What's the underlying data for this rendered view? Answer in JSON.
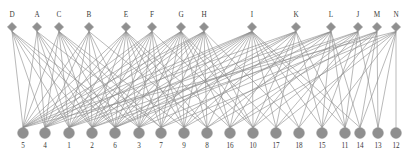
{
  "diagram": {
    "type": "bipartite-graph",
    "title": "",
    "colors": {
      "node": "#8f8f8f",
      "edge": "#8c8c8c",
      "label": "#3a3a3a",
      "background": "#ffffff"
    },
    "top_nodes": [
      {
        "label": "D",
        "x": 12,
        "y": 27
      },
      {
        "label": "A",
        "x": 37,
        "y": 27
      },
      {
        "label": "C",
        "x": 59,
        "y": 27
      },
      {
        "label": "B",
        "x": 89,
        "y": 27
      },
      {
        "label": "E",
        "x": 126,
        "y": 27
      },
      {
        "label": "F",
        "x": 152,
        "y": 27
      },
      {
        "label": "G",
        "x": 181,
        "y": 27
      },
      {
        "label": "H",
        "x": 204,
        "y": 27
      },
      {
        "label": "I",
        "x": 252,
        "y": 27
      },
      {
        "label": "K",
        "x": 296,
        "y": 27
      },
      {
        "label": "L",
        "x": 331,
        "y": 27
      },
      {
        "label": "J",
        "x": 358,
        "y": 27
      },
      {
        "label": "M",
        "x": 377,
        "y": 27
      },
      {
        "label": "N",
        "x": 396,
        "y": 27
      }
    ],
    "bottom_nodes": [
      {
        "label": "5",
        "x": 23,
        "y": 133
      },
      {
        "label": "4",
        "x": 45,
        "y": 133
      },
      {
        "label": "1",
        "x": 69,
        "y": 133
      },
      {
        "label": "2",
        "x": 92,
        "y": 133
      },
      {
        "label": "6",
        "x": 115,
        "y": 133
      },
      {
        "label": "3",
        "x": 139,
        "y": 133
      },
      {
        "label": "7",
        "x": 161,
        "y": 133
      },
      {
        "label": "9",
        "x": 184,
        "y": 133
      },
      {
        "label": "8",
        "x": 207,
        "y": 133
      },
      {
        "label": "16",
        "x": 230,
        "y": 133
      },
      {
        "label": "10",
        "x": 253,
        "y": 133
      },
      {
        "label": "17",
        "x": 276,
        "y": 133
      },
      {
        "label": "18",
        "x": 299,
        "y": 133
      },
      {
        "label": "15",
        "x": 322,
        "y": 133
      },
      {
        "label": "11",
        "x": 345,
        "y": 133
      },
      {
        "label": "14",
        "x": 360,
        "y": 133
      },
      {
        "label": "13",
        "x": 378,
        "y": 133
      },
      {
        "label": "12",
        "x": 396,
        "y": 133
      }
    ],
    "edges": [
      [
        "D",
        "5"
      ],
      [
        "D",
        "4"
      ],
      [
        "D",
        "1"
      ],
      [
        "D",
        "2"
      ],
      [
        "D",
        "6"
      ],
      [
        "D",
        "3"
      ],
      [
        "A",
        "5"
      ],
      [
        "A",
        "4"
      ],
      [
        "A",
        "1"
      ],
      [
        "A",
        "2"
      ],
      [
        "A",
        "6"
      ],
      [
        "A",
        "7"
      ],
      [
        "C",
        "5"
      ],
      [
        "C",
        "4"
      ],
      [
        "C",
        "1"
      ],
      [
        "C",
        "2"
      ],
      [
        "C",
        "6"
      ],
      [
        "C",
        "3"
      ],
      [
        "C",
        "7"
      ],
      [
        "C",
        "9"
      ],
      [
        "B",
        "5"
      ],
      [
        "B",
        "4"
      ],
      [
        "B",
        "1"
      ],
      [
        "B",
        "2"
      ],
      [
        "B",
        "6"
      ],
      [
        "B",
        "3"
      ],
      [
        "B",
        "8"
      ],
      [
        "E",
        "5"
      ],
      [
        "E",
        "4"
      ],
      [
        "E",
        "1"
      ],
      [
        "E",
        "2"
      ],
      [
        "E",
        "6"
      ],
      [
        "E",
        "3"
      ],
      [
        "E",
        "7"
      ],
      [
        "E",
        "9"
      ],
      [
        "E",
        "8"
      ],
      [
        "E",
        "16"
      ],
      [
        "F",
        "5"
      ],
      [
        "F",
        "4"
      ],
      [
        "F",
        "1"
      ],
      [
        "F",
        "2"
      ],
      [
        "F",
        "6"
      ],
      [
        "F",
        "3"
      ],
      [
        "F",
        "7"
      ],
      [
        "F",
        "9"
      ],
      [
        "F",
        "10"
      ],
      [
        "G",
        "5"
      ],
      [
        "G",
        "4"
      ],
      [
        "G",
        "1"
      ],
      [
        "G",
        "2"
      ],
      [
        "G",
        "6"
      ],
      [
        "G",
        "3"
      ],
      [
        "G",
        "7"
      ],
      [
        "G",
        "9"
      ],
      [
        "G",
        "8"
      ],
      [
        "G",
        "16"
      ],
      [
        "G",
        "10"
      ],
      [
        "G",
        "17"
      ],
      [
        "H",
        "5"
      ],
      [
        "H",
        "4"
      ],
      [
        "H",
        "1"
      ],
      [
        "H",
        "2"
      ],
      [
        "H",
        "6"
      ],
      [
        "H",
        "3"
      ],
      [
        "H",
        "7"
      ],
      [
        "H",
        "9"
      ],
      [
        "H",
        "8"
      ],
      [
        "H",
        "16"
      ],
      [
        "H",
        "10"
      ],
      [
        "H",
        "18"
      ],
      [
        "I",
        "5"
      ],
      [
        "I",
        "4"
      ],
      [
        "I",
        "1"
      ],
      [
        "I",
        "2"
      ],
      [
        "I",
        "6"
      ],
      [
        "I",
        "3"
      ],
      [
        "I",
        "7"
      ],
      [
        "I",
        "9"
      ],
      [
        "I",
        "8"
      ],
      [
        "I",
        "16"
      ],
      [
        "I",
        "10"
      ],
      [
        "I",
        "17"
      ],
      [
        "I",
        "18"
      ],
      [
        "I",
        "15"
      ],
      [
        "I",
        "11"
      ],
      [
        "I",
        "14"
      ],
      [
        "K",
        "5"
      ],
      [
        "K",
        "1"
      ],
      [
        "K",
        "6"
      ],
      [
        "K",
        "3"
      ],
      [
        "K",
        "9"
      ],
      [
        "K",
        "16"
      ],
      [
        "K",
        "10"
      ],
      [
        "K",
        "17"
      ],
      [
        "K",
        "15"
      ],
      [
        "K",
        "11"
      ],
      [
        "L",
        "4"
      ],
      [
        "L",
        "2"
      ],
      [
        "L",
        "6"
      ],
      [
        "L",
        "7"
      ],
      [
        "L",
        "8"
      ],
      [
        "L",
        "10"
      ],
      [
        "L",
        "18"
      ],
      [
        "L",
        "15"
      ],
      [
        "L",
        "11"
      ],
      [
        "L",
        "14"
      ],
      [
        "J",
        "1"
      ],
      [
        "J",
        "6"
      ],
      [
        "J",
        "9"
      ],
      [
        "J",
        "16"
      ],
      [
        "J",
        "17"
      ],
      [
        "J",
        "15"
      ],
      [
        "J",
        "11"
      ],
      [
        "J",
        "13"
      ],
      [
        "M",
        "2"
      ],
      [
        "M",
        "3"
      ],
      [
        "M",
        "8"
      ],
      [
        "M",
        "10"
      ],
      [
        "M",
        "18"
      ],
      [
        "M",
        "11"
      ],
      [
        "M",
        "14"
      ],
      [
        "M",
        "13"
      ],
      [
        "N",
        "5"
      ],
      [
        "N",
        "7"
      ],
      [
        "N",
        "16"
      ],
      [
        "N",
        "17"
      ],
      [
        "N",
        "15"
      ],
      [
        "N",
        "14"
      ],
      [
        "N",
        "13"
      ],
      [
        "N",
        "12"
      ]
    ]
  }
}
